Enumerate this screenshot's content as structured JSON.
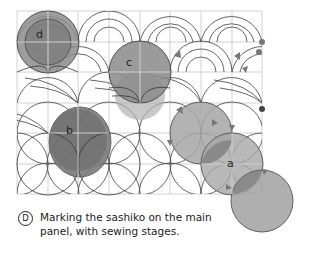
{
  "figure": {
    "badge": "D",
    "caption": "Marking the sashiko on the main panel, with sewing stages."
  },
  "labels": {
    "a": "a",
    "b": "b",
    "c": "c",
    "d": "d"
  },
  "colors": {
    "grid": "#d0d0d0",
    "stitch_line": "#444444",
    "fill_light": "#a8a8a8",
    "fill_mid": "#8a8a8a",
    "fill_dark": "#6e6e6e",
    "arrow": "#777777"
  }
}
